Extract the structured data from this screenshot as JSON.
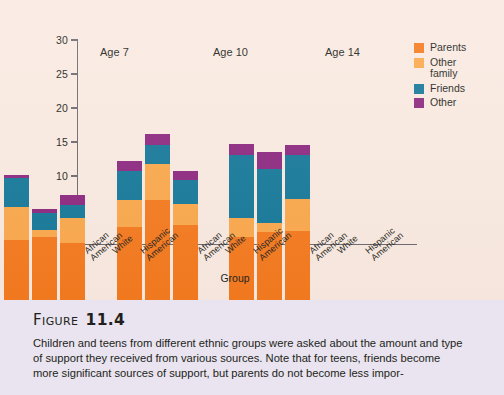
{
  "figure": {
    "label_word": "Figure",
    "label_number": "11.4",
    "caption": "Children and teens from different ethnic groups were asked about the amount and type of support they received from various sources. Note that for teens, friends become more significant sources of support, but parents do not become less impor-"
  },
  "colors": {
    "parents": "#F57B20",
    "other_family": "#FBA94D",
    "friends": "#17799A",
    "other": "#8E2980",
    "chart_background": "#FAEAE1",
    "caption_background": "#E9E4EF",
    "axis": "#6D6A72",
    "text": "#231F20"
  },
  "legend": {
    "position": "right",
    "entries": [
      {
        "label": "Parents",
        "color": "#F57B20"
      },
      {
        "label": "Other\nfamily",
        "color": "#FBA94D"
      },
      {
        "label": "Friends",
        "color": "#17799A"
      },
      {
        "label": "Other",
        "color": "#8E2980"
      }
    ]
  },
  "chart_data": {
    "type": "bar",
    "subtype": "stacked",
    "title": "",
    "xlabel": "Group",
    "ylabel": "Support",
    "ylim": [
      0,
      30
    ],
    "yticks": [
      0,
      5,
      10,
      15,
      20,
      25,
      30
    ],
    "ytick_labels": [
      "0",
      "5",
      "10",
      "15",
      "20",
      "25",
      "30"
    ],
    "grid": false,
    "group_titles": [
      "Age 7",
      "Age 10",
      "Age 14"
    ],
    "categories": [
      "African\nAmerican",
      "White",
      "Hispanic\nAmerican",
      "African\nAmerican",
      "White",
      "Hispanic\nAmerican",
      "African\nAmerican",
      "White",
      "Hispanic\nAmerican"
    ],
    "series": [
      {
        "name": "Parents",
        "color": "#F57B20",
        "values": [
          8.8,
          9.2,
          8.4,
          10.7,
          14.7,
          11.0,
          9.3,
          10.0,
          10.2
        ]
      },
      {
        "name": "Other family",
        "color": "#FBA94D",
        "values": [
          4.9,
          1.1,
          3.7,
          4.0,
          5.3,
          3.1,
          2.7,
          1.3,
          4.6
        ]
      },
      {
        "name": "Friends",
        "color": "#17799A",
        "values": [
          4.2,
          2.5,
          1.9,
          4.3,
          2.8,
          3.6,
          9.3,
          8.0,
          6.5
        ]
      },
      {
        "name": "Other",
        "color": "#8E2980",
        "values": [
          0.5,
          0.6,
          1.4,
          1.5,
          1.6,
          1.3,
          1.7,
          2.5,
          1.5
        ]
      }
    ],
    "totals": [
      18.4,
      13.4,
      15.4,
      20.5,
      24.4,
      19.0,
      23.0,
      21.8,
      22.8
    ]
  }
}
